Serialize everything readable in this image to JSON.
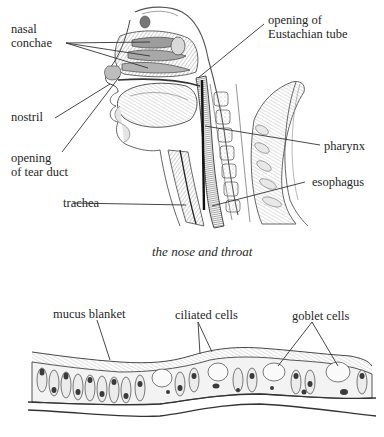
{
  "figure_top": {
    "title": "the nose and throat",
    "labels": {
      "nasal_conchae": [
        "nasal",
        "conchae"
      ],
      "nostril": "nostril",
      "tear_duct": [
        "opening",
        "of tear duct"
      ],
      "trachea": "trachea",
      "eustachian": [
        "opening of",
        "Eustachian tube"
      ],
      "pharynx": "pharynx",
      "esophagus": "esophagus"
    }
  },
  "figure_bottom": {
    "labels": {
      "mucus_blanket": "mucus blanket",
      "ciliated_cells": "ciliated cells",
      "goblet_cells": "goblet cells"
    }
  },
  "colors": {
    "ink": "#2a2a2a",
    "shade": "#7a7a7a",
    "light_shade": "#c9c9c9",
    "background": "#ffffff"
  }
}
